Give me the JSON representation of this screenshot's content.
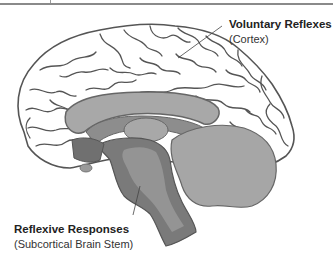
{
  "diagram": {
    "type": "brain-sagittal-section",
    "colors": {
      "cortex_fill": "#ffffff",
      "cortex_outline": "#555555",
      "inner_light": "#a8a8a8",
      "inner_mid": "#9a9a9a",
      "brain_stem_dark": "#7a7a7a",
      "cerebellum": "#a6a6a6",
      "label_text": "#222222"
    }
  },
  "labels": {
    "voluntary": {
      "title": "Voluntary Reflexes",
      "subtitle": "(Cortex)"
    },
    "reflexive": {
      "title": "Reflexive Responses",
      "subtitle": "(Subcortical Brain Stem)"
    }
  }
}
